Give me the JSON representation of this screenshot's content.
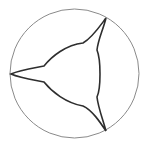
{
  "diagram": {
    "type": "geometric-figure",
    "background": "#ffffff",
    "circle": {
      "cx": 74.5,
      "cy": 73.5,
      "r": 64.5,
      "stroke": "#8a8a8a",
      "stroke_width": 1
    },
    "star": {
      "stroke": "#2e2e2e",
      "stroke_width": 1.6,
      "fill": "none",
      "tips": [
        {
          "name": "top",
          "x": 106,
          "y": 18
        },
        {
          "name": "left",
          "x": 11,
          "y": 74
        },
        {
          "name": "bottom",
          "x": 106,
          "y": 131
        }
      ],
      "path": "M106,18 C103,30 98,40 97,50 C101,60 101,88 97,97 C98,107 103,120 106,131 C100,122 92,110 83,106 C66,103 52,92 44,82 C34,80 20,78 11,74 C20,70 34,68 44,66 C52,56 66,45 83,43 C92,38 100,26 106,18 Z"
    }
  }
}
